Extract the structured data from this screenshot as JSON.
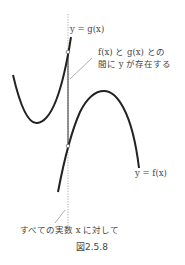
{
  "figure": {
    "caption": "図2.5.8",
    "labels": {
      "g_curve": "y = g(x)",
      "f_curve": "y = f(x)",
      "between_line1": "f(x) と g(x) との",
      "between_line2": "間に y が存在する",
      "for_all": "すべての実数 x に対して"
    },
    "colors": {
      "curve": "#222222",
      "dotted_line": "#888888",
      "leader": "#777777",
      "text": "#444444"
    }
  }
}
